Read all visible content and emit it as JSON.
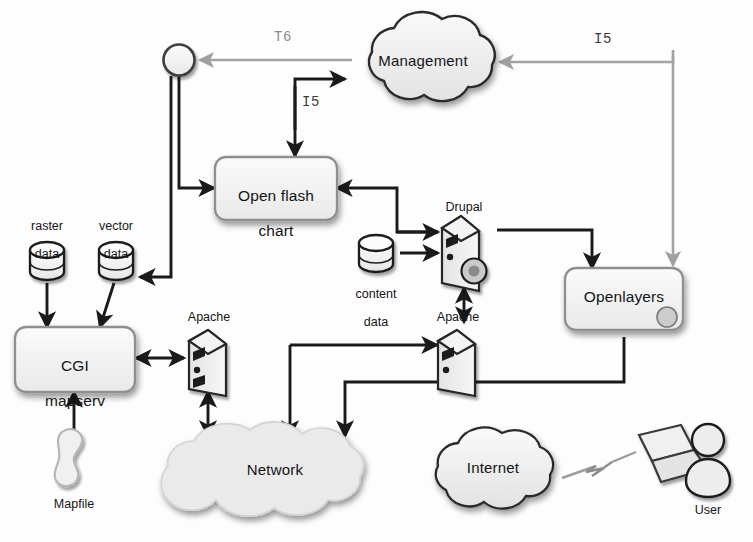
{
  "diagram": {
    "style": {
      "background": "#fdfdfd",
      "ink_dark": "#1a1a1a",
      "ink_gray": "#9a9a9a",
      "fill_light": "#f2f2f2",
      "fill_shade": "#d8d8d8",
      "text_color": "#151515"
    },
    "nodes": [
      {
        "id": "junction",
        "label": "",
        "shape": "circle",
        "x": 179,
        "y": 60
      },
      {
        "id": "management",
        "label": "Management",
        "shape": "cloud",
        "x": 423,
        "y": 62
      },
      {
        "id": "open_flash_chart",
        "label": "Open flash\nchart",
        "shape": "rounded-box",
        "x": 273,
        "y": 188
      },
      {
        "id": "drupal",
        "label": "Drupal",
        "shape": "server",
        "x": 464,
        "y": 243
      },
      {
        "id": "openlayers",
        "label": "Openlayers",
        "shape": "rounded-box",
        "x": 624,
        "y": 300
      },
      {
        "id": "raster_data",
        "label": "raster\ndata",
        "shape": "cylinder",
        "x": 47,
        "y": 258
      },
      {
        "id": "vector_data",
        "label": "vector\ndata",
        "shape": "cylinder",
        "x": 116,
        "y": 258
      },
      {
        "id": "content_data",
        "label": "content\ndata",
        "shape": "cylinder",
        "x": 376,
        "y": 252
      },
      {
        "id": "cgi_mapserv",
        "label": "CGI\nmapserv",
        "shape": "rounded-box",
        "x": 73,
        "y": 358
      },
      {
        "id": "apache_left",
        "label": "Apache",
        "shape": "server",
        "x": 208,
        "y": 360
      },
      {
        "id": "apache_right",
        "label": "Apache",
        "shape": "server",
        "x": 457,
        "y": 360
      },
      {
        "id": "mapfile",
        "label": "Mapfile",
        "shape": "blob",
        "x": 72,
        "y": 460
      },
      {
        "id": "network",
        "label": "Network",
        "shape": "cloud",
        "x": 275,
        "y": 470
      },
      {
        "id": "internet",
        "label": "Internet",
        "shape": "cloud",
        "x": 493,
        "y": 468
      },
      {
        "id": "laptop",
        "label": "",
        "shape": "laptop",
        "x": 649,
        "y": 452
      },
      {
        "id": "user",
        "label": "User",
        "shape": "person",
        "x": 707,
        "y": 460
      }
    ],
    "edge_labels": [
      {
        "id": "t6",
        "text": "T6",
        "x": 278,
        "y": 36,
        "tone": "gray"
      },
      {
        "id": "i5_center",
        "text": "I5",
        "x": 306,
        "y": 100,
        "tone": "dark"
      },
      {
        "id": "i5_right",
        "text": "I5",
        "x": 597,
        "y": 38,
        "tone": "dark"
      }
    ],
    "node_labels": {
      "management": "Management",
      "open_flash_chart_line1": "Open flash",
      "open_flash_chart_line2": "chart",
      "drupal": "Drupal",
      "openlayers": "Openlayers",
      "raster_data_line1": "raster",
      "raster_data_line2": "data",
      "vector_data_line1": "vector",
      "vector_data_line2": "data",
      "content_data_line1": "content",
      "content_data_line2": "data",
      "cgi_mapserv_line1": "CGI",
      "cgi_mapserv_line2": "mapserv",
      "apache_left": "Apache",
      "apache_right": "Apache",
      "mapfile": "Mapfile",
      "network": "Network",
      "internet": "Internet",
      "user": "User"
    },
    "connections": [
      {
        "from": "management",
        "to": "junction",
        "label": "T6",
        "tone": "gray",
        "arrows": "one-way"
      },
      {
        "from": "open_flash_chart_branch",
        "to": "management",
        "label": "I5",
        "tone": "dark",
        "arrows": "one-way"
      },
      {
        "from": "management_path",
        "to": "open_flash_chart",
        "label": "I5",
        "tone": "dark",
        "arrows": "one-way"
      },
      {
        "from": "openlayers_path",
        "to": "management",
        "label": "I5",
        "tone": "dark",
        "arrows": "one-way"
      },
      {
        "from": "junction",
        "to": "open_flash_chart",
        "tone": "dark",
        "arrows": "one-way"
      },
      {
        "from": "junction",
        "to": "vector_data",
        "tone": "dark",
        "arrows": "one-way"
      },
      {
        "from": "drupal",
        "to": "open_flash_chart",
        "tone": "dark",
        "arrows": "one-way"
      },
      {
        "from": "drupal",
        "to": "openlayers",
        "tone": "dark",
        "arrows": "one-way"
      },
      {
        "from": "content_data",
        "to": "drupal",
        "tone": "dark",
        "arrows": "one-way"
      },
      {
        "from": "drupal",
        "to": "apache_right",
        "tone": "dark",
        "arrows": "two-way"
      },
      {
        "from": "raster_data",
        "to": "cgi_mapserv",
        "tone": "dark",
        "arrows": "one-way"
      },
      {
        "from": "vector_data",
        "to": "cgi_mapserv",
        "tone": "dark",
        "arrows": "one-way"
      },
      {
        "from": "mapfile",
        "to": "cgi_mapserv",
        "tone": "dark",
        "arrows": "one-way"
      },
      {
        "from": "cgi_mapserv",
        "to": "apache_left",
        "tone": "dark",
        "arrows": "two-way"
      },
      {
        "from": "apache_left",
        "to": "network",
        "tone": "dark",
        "arrows": "two-way"
      },
      {
        "from": "apache_right",
        "to": "network",
        "tone": "dark",
        "arrows": "one-way"
      },
      {
        "from": "openlayers",
        "to": "network",
        "tone": "dark",
        "arrows": "one-way"
      },
      {
        "from": "internet",
        "to": "laptop",
        "tone": "gray",
        "arrows": "wireless"
      }
    ]
  }
}
